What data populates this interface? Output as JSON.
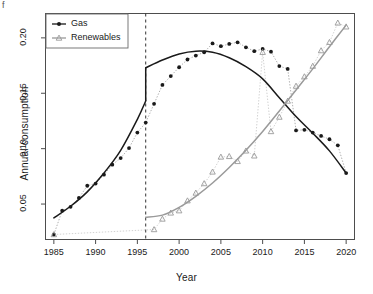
{
  "chart_data": {
    "type": "scatter",
    "title": "",
    "xlabel": "Year",
    "ylabel": "Annual consumption",
    "xlim": [
      1984,
      2021
    ],
    "ylim": [
      0.018,
      0.222
    ],
    "xticks": [
      1985,
      1990,
      1995,
      2000,
      2005,
      2010,
      2015,
      2020
    ],
    "yticks": [
      0.05,
      0.1,
      0.15,
      0.2
    ],
    "grid": false,
    "legend_position": "top-left",
    "annotations": [
      {
        "name": "breakpoint-line",
        "type": "vline",
        "x": 1996,
        "style": "dashed",
        "color": "#333333"
      }
    ],
    "series": [
      {
        "name": "Gas",
        "color": "#1a1a1a",
        "marker": "filled-circle",
        "x": [
          1985,
          1986,
          1987,
          1988,
          1989,
          1990,
          1991,
          1992,
          1993,
          1994,
          1995,
          1996,
          1997,
          1998,
          1999,
          2000,
          2001,
          2002,
          2003,
          2004,
          2005,
          2006,
          2007,
          2008,
          2009,
          2010,
          2011,
          2012,
          2013,
          2014,
          2015,
          2016,
          2017,
          2018,
          2019,
          2020
        ],
        "values": [
          0.0225,
          0.044,
          0.0475,
          0.0555,
          0.0665,
          0.0685,
          0.0765,
          0.0855,
          0.0915,
          0.1005,
          0.1145,
          0.1235,
          0.1405,
          0.1575,
          0.1655,
          0.1735,
          0.1805,
          0.184,
          0.187,
          0.195,
          0.1925,
          0.1945,
          0.196,
          0.1915,
          0.188,
          0.19,
          0.1875,
          0.1745,
          0.172,
          0.1705,
          0.162,
          0.1545,
          0.143,
          0.1365,
          0.1165,
          0.117
        ],
        "values_note": "second half of the series continues: see values_tail",
        "values_tail_x": [
          2014,
          2015,
          2016,
          2017,
          2018,
          2019,
          2020
        ],
        "values_tail": [
          0.1165,
          0.117,
          0.1145,
          0.1115,
          0.1085,
          0.103,
          0.078
        ],
        "fit_left": {
          "x": [
            1985,
            1987,
            1989,
            1991,
            1993,
            1995,
            1996
          ],
          "y": [
            0.0375,
            0.048,
            0.061,
            0.078,
            0.0985,
            0.1265,
            0.143
          ]
        },
        "fit_right": {
          "x": [
            1996,
            1998,
            2000,
            2002,
            2004,
            2006,
            2008,
            2010,
            2012,
            2014,
            2016,
            2018,
            2020
          ],
          "y": [
            0.173,
            0.18,
            0.1855,
            0.188,
            0.187,
            0.182,
            0.174,
            0.163,
            0.146,
            0.129,
            0.114,
            0.098,
            0.078
          ]
        }
      },
      {
        "name": "Renewables",
        "color": "#9a9a9a",
        "marker": "open-triangle",
        "x": [
          1985,
          1997,
          1998,
          1999,
          2000,
          2001,
          2002,
          2003,
          2004,
          2005,
          2006,
          2007,
          2008,
          2009,
          2010,
          2011,
          2012,
          2013,
          2014,
          2015,
          2016,
          2017,
          2018,
          2019,
          2020
        ],
        "values": [
          0.0225,
          0.027,
          0.0365,
          0.042,
          0.044,
          0.053,
          0.06,
          0.0685,
          0.079,
          0.0925,
          0.093,
          0.0885,
          0.098,
          0.0935,
          0.187,
          0.1155,
          0.1285,
          0.143,
          0.1565,
          0.165,
          0.1745,
          0.1885,
          0.196,
          0.2135,
          0.21
        ],
        "fit": {
          "x": [
            1996,
            1998,
            2000,
            2002,
            2004,
            2006,
            2008,
            2010,
            2012,
            2014,
            2016,
            2018,
            2020
          ],
          "y": [
            0.038,
            0.04,
            0.047,
            0.057,
            0.069,
            0.083,
            0.0985,
            0.1155,
            0.134,
            0.153,
            0.172,
            0.192,
            0.2115
          ]
        }
      }
    ]
  },
  "legend": {
    "entries": [
      {
        "label": "Gas",
        "marker": "filled-circle",
        "color": "#1a1a1a"
      },
      {
        "label": "Renewables",
        "marker": "open-triangle",
        "color": "#9a9a9a"
      }
    ]
  },
  "axes": {
    "x_title": "Year",
    "y_title": "Annual consumption",
    "x_tick_labels": [
      "1985",
      "1990",
      "1995",
      "2000",
      "2005",
      "2010",
      "2015",
      "2020"
    ],
    "y_tick_labels": [
      "0.05",
      "0.10",
      "0.15",
      "0.20"
    ]
  },
  "page": {
    "corner_mark": "f"
  }
}
